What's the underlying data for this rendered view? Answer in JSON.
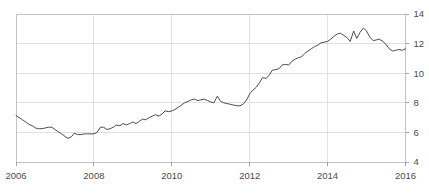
{
  "chart_data": {
    "type": "line",
    "title": "",
    "subtitle": "",
    "xlabel": "",
    "ylabel": "",
    "xlim": [
      2006.0,
      2016.0
    ],
    "ylim": [
      4,
      14
    ],
    "grid": true,
    "legend": false,
    "legend_position": "none",
    "x_ticks": [
      2006,
      2008,
      2010,
      2012,
      2014,
      2016
    ],
    "x_tick_labels": [
      "2006",
      "2008",
      "2010",
      "2012",
      "2014",
      "2016"
    ],
    "y_ticks": [
      4,
      6,
      8,
      10,
      12,
      14
    ],
    "y_tick_labels": [
      "4",
      "6",
      "8",
      "10",
      "12",
      "14"
    ],
    "y_axis_side": "right",
    "line_color": "#4c4c4c",
    "grid_color": "#d9d9d9",
    "axis_color": "#bdbdbd",
    "series": [
      {
        "name": "value",
        "x": [
          2006.0,
          2006.08,
          2006.17,
          2006.25,
          2006.33,
          2006.42,
          2006.5,
          2006.58,
          2006.67,
          2006.75,
          2006.83,
          2006.92,
          2007.0,
          2007.08,
          2007.17,
          2007.25,
          2007.33,
          2007.42,
          2007.5,
          2007.58,
          2007.67,
          2007.75,
          2007.83,
          2007.92,
          2008.0,
          2008.08,
          2008.17,
          2008.25,
          2008.33,
          2008.42,
          2008.5,
          2008.58,
          2008.67,
          2008.75,
          2008.83,
          2008.92,
          2009.0,
          2009.08,
          2009.17,
          2009.25,
          2009.33,
          2009.42,
          2009.5,
          2009.58,
          2009.67,
          2009.75,
          2009.83,
          2009.92,
          2010.0,
          2010.08,
          2010.17,
          2010.25,
          2010.33,
          2010.42,
          2010.5,
          2010.58,
          2010.67,
          2010.75,
          2010.83,
          2010.92,
          2011.0,
          2011.08,
          2011.17,
          2011.25,
          2011.33,
          2011.42,
          2011.5,
          2011.58,
          2011.67,
          2011.75,
          2011.83,
          2011.92,
          2012.0,
          2012.08,
          2012.17,
          2012.25,
          2012.33,
          2012.42,
          2012.5,
          2012.58,
          2012.67,
          2012.75,
          2012.83,
          2012.92,
          2013.0,
          2013.08,
          2013.17,
          2013.25,
          2013.33,
          2013.42,
          2013.5,
          2013.58,
          2013.67,
          2013.75,
          2013.83,
          2013.92,
          2014.0,
          2014.08,
          2014.17,
          2014.25,
          2014.33,
          2014.42,
          2014.5,
          2014.58,
          2014.67,
          2014.75,
          2014.83,
          2014.92,
          2015.0,
          2015.08,
          2015.17,
          2015.25,
          2015.33,
          2015.42,
          2015.5,
          2015.58,
          2015.67,
          2015.75,
          2015.83,
          2015.92,
          2016.0
        ],
        "y": [
          7.15,
          7.0,
          6.85,
          6.7,
          6.55,
          6.45,
          6.3,
          6.25,
          6.25,
          6.3,
          6.35,
          6.35,
          6.2,
          6.05,
          5.9,
          5.75,
          5.6,
          5.7,
          5.95,
          5.85,
          5.85,
          5.9,
          5.9,
          5.9,
          5.9,
          6.0,
          6.35,
          6.35,
          6.2,
          6.25,
          6.35,
          6.5,
          6.45,
          6.6,
          6.5,
          6.6,
          6.7,
          6.6,
          6.75,
          6.9,
          6.85,
          7.0,
          7.1,
          7.2,
          7.1,
          7.25,
          7.45,
          7.4,
          7.45,
          7.55,
          7.7,
          7.85,
          8.0,
          8.1,
          8.2,
          8.25,
          8.15,
          8.2,
          8.25,
          8.15,
          8.05,
          8.0,
          8.45,
          8.1,
          8.0,
          7.95,
          7.9,
          7.85,
          7.8,
          7.8,
          7.9,
          8.2,
          8.6,
          8.85,
          9.05,
          9.35,
          9.7,
          9.65,
          9.85,
          10.2,
          10.25,
          10.3,
          10.55,
          10.6,
          10.55,
          10.8,
          10.95,
          11.05,
          11.1,
          11.35,
          11.5,
          11.65,
          11.8,
          11.9,
          12.05,
          12.1,
          12.15,
          12.3,
          12.5,
          12.65,
          12.7,
          12.55,
          12.4,
          12.15,
          12.85,
          12.35,
          12.75,
          13.05,
          12.85,
          12.45,
          12.2,
          12.25,
          12.3,
          12.15,
          11.95,
          11.65,
          11.5,
          11.55,
          11.6,
          11.55,
          11.65
        ]
      }
    ]
  },
  "axes": {
    "x_labels": [
      "2006",
      "2008",
      "2010",
      "2012",
      "2014",
      "2016"
    ],
    "y_labels": [
      "14",
      "12",
      "10",
      "8",
      "6",
      "4"
    ]
  }
}
